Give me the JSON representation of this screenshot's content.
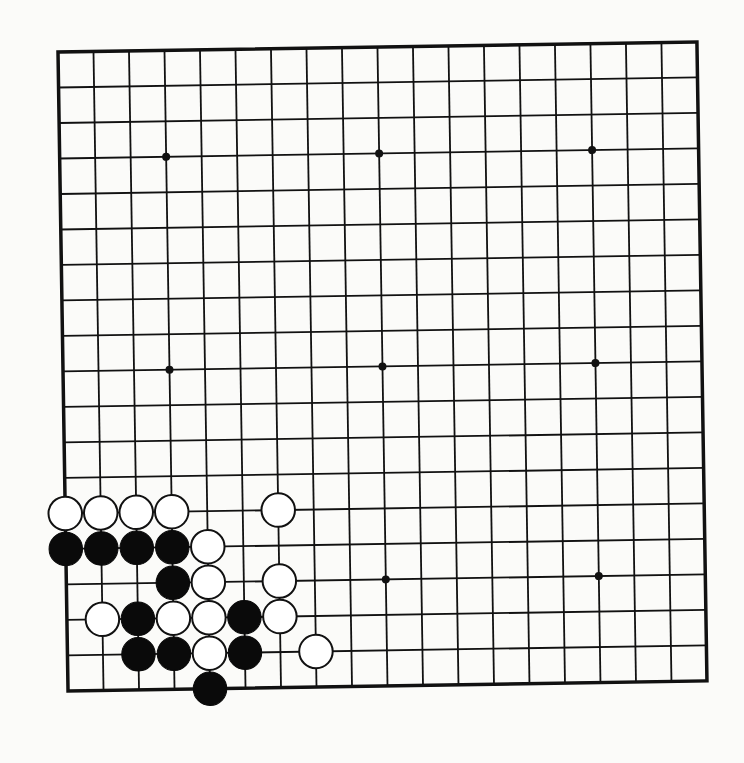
{
  "board": {
    "size": 19,
    "origin": {
      "x": 58,
      "y": 52
    },
    "spacing": 35.5,
    "rotation_deg": -0.9,
    "line_color": "#111111",
    "background": "#fbfbf9",
    "star_points": [
      [
        3,
        3
      ],
      [
        9,
        3
      ],
      [
        15,
        3
      ],
      [
        3,
        9
      ],
      [
        9,
        9
      ],
      [
        15,
        9
      ],
      [
        3,
        15
      ],
      [
        9,
        15
      ],
      [
        15,
        15
      ]
    ]
  },
  "stones": [
    {
      "color": "white",
      "col": 0,
      "row": 13
    },
    {
      "color": "white",
      "col": 1,
      "row": 13
    },
    {
      "color": "white",
      "col": 2,
      "row": 13
    },
    {
      "color": "white",
      "col": 3,
      "row": 13
    },
    {
      "color": "white",
      "col": 6,
      "row": 13
    },
    {
      "color": "black",
      "col": 0,
      "row": 14
    },
    {
      "color": "black",
      "col": 1,
      "row": 14
    },
    {
      "color": "black",
      "col": 2,
      "row": 14
    },
    {
      "color": "black",
      "col": 3,
      "row": 14
    },
    {
      "color": "white",
      "col": 4,
      "row": 14
    },
    {
      "color": "black",
      "col": 3,
      "row": 15
    },
    {
      "color": "white",
      "col": 4,
      "row": 15
    },
    {
      "color": "white",
      "col": 6,
      "row": 15
    },
    {
      "color": "white",
      "col": 1,
      "row": 16
    },
    {
      "color": "black",
      "col": 2,
      "row": 16
    },
    {
      "color": "white",
      "col": 3,
      "row": 16
    },
    {
      "color": "white",
      "col": 4,
      "row": 16
    },
    {
      "color": "black",
      "col": 5,
      "row": 16
    },
    {
      "color": "white",
      "col": 6,
      "row": 16
    },
    {
      "color": "black",
      "col": 2,
      "row": 17
    },
    {
      "color": "black",
      "col": 3,
      "row": 17
    },
    {
      "color": "white",
      "col": 4,
      "row": 17
    },
    {
      "color": "black",
      "col": 5,
      "row": 17
    },
    {
      "color": "white",
      "col": 7,
      "row": 17
    },
    {
      "color": "black",
      "col": 4,
      "row": 18
    }
  ]
}
